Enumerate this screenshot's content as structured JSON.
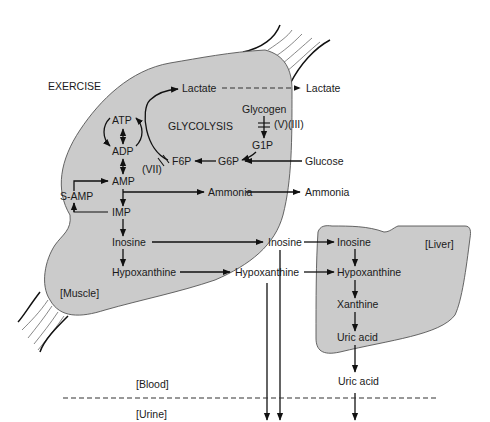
{
  "diagram": {
    "compartments": {
      "exercise": "EXERCISE",
      "muscle": "[Muscle]",
      "liver": "[Liver]",
      "blood": "[Blood]",
      "urine": "[Urine]"
    },
    "muscle_nodes": {
      "lactate": "Lactate",
      "glycolysis": "GLYCOLYSIS",
      "glycogen": "Glycogen",
      "enzyme_v_iii": "(V)(III)",
      "g1p": "G1P",
      "g6p": "G6P",
      "f6p": "F6P",
      "enzyme_vii": "(VII)",
      "atp": "ATP",
      "adp": "ADP",
      "amp": "AMP",
      "s_amp": "S-AMP",
      "imp": "IMP",
      "ammonia": "Ammonia",
      "inosine": "Inosine",
      "hypoxanthine": "Hypoxanthine"
    },
    "blood_nodes": {
      "lactate": "Lactate",
      "glucose": "Glucose",
      "ammonia": "Ammonia",
      "inosine": "Inosine",
      "hypoxanthine": "Hypoxanthine",
      "uric_acid": "Uric acid"
    },
    "liver_nodes": {
      "inosine": "Inosine",
      "hypoxanthine": "Hypoxanthine",
      "xanthine": "Xanthine",
      "uric_acid": "Uric acid"
    },
    "colors": {
      "organ_fill": "#cbcbcb",
      "outline": "#555555",
      "arrow": "#111111"
    }
  }
}
